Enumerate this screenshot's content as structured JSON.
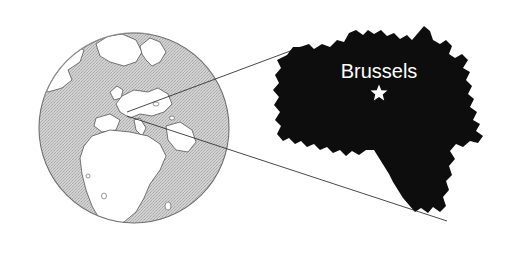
{
  "figure": {
    "name": "belgium-locator-map",
    "background_color": "#ffffff",
    "width": 523,
    "height": 256
  },
  "globe": {
    "name": "world-globe",
    "center_x": 134,
    "center_y": 128,
    "radius": 96,
    "ocean_color": "#c8c8c8",
    "land_color": "#ffffff",
    "outline_color": "#555555",
    "regions_shown": [
      "Europe",
      "Africa",
      "Greenland",
      "North America",
      "Mediterranean Sea",
      "Middle East"
    ]
  },
  "country_map": {
    "name": "belgium-silhouette",
    "country": "Belgium",
    "fill_color": "#0d0d0d",
    "bounds": {
      "left": 275,
      "top": 25,
      "right": 500,
      "bottom": 225
    }
  },
  "capital": {
    "label": "Brussels",
    "label_x": 379,
    "label_y": 78,
    "label_color": "#ffffff",
    "marker_icon": "star-icon",
    "marker_color": "#ffffff",
    "marker_x": 379,
    "marker_y": 92
  },
  "connectors": {
    "color": "#333333",
    "stroke_width": 0.9,
    "origin_x": 127,
    "origin_y": 112,
    "lines": [
      {
        "name": "upper-connector",
        "x1": 127,
        "y1": 112,
        "x2": 301,
        "y2": 47
      },
      {
        "name": "lower-connector",
        "x1": 127,
        "y1": 116,
        "x2": 447,
        "y2": 221
      }
    ]
  }
}
